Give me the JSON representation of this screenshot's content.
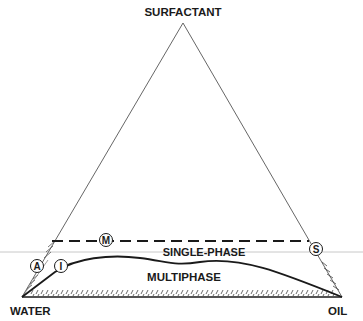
{
  "diagram": {
    "type": "ternary-phase-diagram",
    "vertices": {
      "top": "SURFACTANT",
      "bottom_left": "WATER",
      "bottom_right": "OIL"
    },
    "regions": {
      "upper": "SINGLE-PHASE",
      "lower": "MULTIPHASE"
    },
    "markers": [
      {
        "id": "A",
        "label": "A"
      },
      {
        "id": "I",
        "label": "I"
      },
      {
        "id": "M",
        "label": "M"
      },
      {
        "id": "S",
        "label": "S"
      }
    ],
    "colors": {
      "line": "#1a1a1a",
      "triangle_edge": "#555555",
      "separator": "#c8c8c8",
      "background": "#ffffff"
    }
  }
}
